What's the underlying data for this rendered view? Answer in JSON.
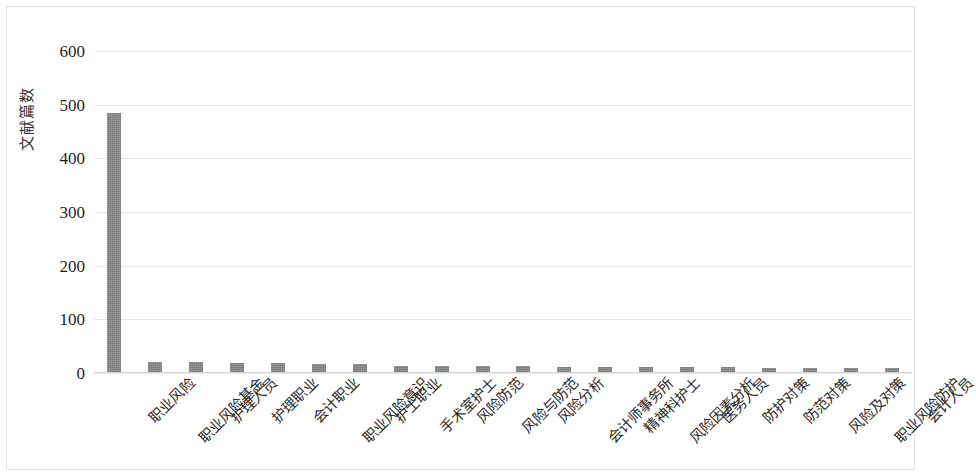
{
  "chart_data": {
    "type": "bar",
    "title": "",
    "xlabel": "",
    "ylabel": "文献篇数",
    "ylim": [
      0,
      600
    ],
    "yticks": [
      "0",
      "100",
      "200",
      "300",
      "400",
      "500",
      "600"
    ],
    "ytick_values": [
      0,
      100,
      200,
      300,
      400,
      500,
      600
    ],
    "grid": true,
    "legend": "none",
    "bar_color": "#848484",
    "gridline_color": "#e8e8e8",
    "categories": [
      "职业风险",
      "职业风险基金",
      "护理人员",
      "护理职业",
      "会计职业",
      "职业风险意识",
      "护士职业",
      "手术室护士",
      "风险防范",
      "风险与防范",
      "风险分析",
      "会计师事务所",
      "精神科护士",
      "风险因素分析",
      "医务人员",
      "防护对策",
      "防范对策",
      "风险及对策",
      "职业风险防护",
      "会计人员"
    ],
    "values": [
      485,
      20,
      20,
      19,
      18,
      17,
      16,
      14,
      14,
      13,
      13,
      12,
      12,
      11,
      11,
      11,
      10,
      10,
      9,
      9
    ]
  }
}
